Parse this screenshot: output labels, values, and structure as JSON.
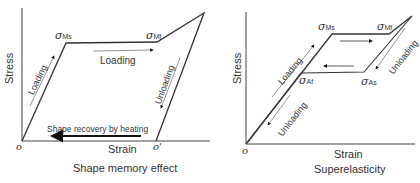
{
  "diagrams": [
    {
      "id": "shape-memory",
      "caption": "Shape memory effect",
      "x_axis_label": "Strain",
      "y_axis_label": "Stress",
      "origin_label": "o",
      "residual_origin_label": "o'",
      "points": {
        "sigma_Ms": {
          "symbol": "σ",
          "sub": "Ms"
        },
        "sigma_Mf": {
          "symbol": "σ",
          "sub": "Mf"
        }
      },
      "annotations": {
        "loading_diag": "Loading",
        "loading_plateau": "Loading",
        "unloading": "Unloading",
        "recovery": "Shape recovery by heating"
      }
    },
    {
      "id": "superelasticity",
      "caption": "Superelasticity",
      "x_axis_label": "Strain",
      "y_axis_label": "Stress",
      "origin_label": "o",
      "points": {
        "sigma_Ms": {
          "symbol": "σ",
          "sub": "Ms"
        },
        "sigma_Mf": {
          "symbol": "σ",
          "sub": "Mf"
        },
        "sigma_As": {
          "symbol": "σ",
          "sub": "As"
        },
        "sigma_Af": {
          "symbol": "σ",
          "sub": "Af"
        }
      },
      "annotations": {
        "loading": "Loading",
        "unloading_upper": "Unloading",
        "unloading_lower": "Unloading"
      }
    }
  ],
  "colors": {
    "line": "#333333",
    "arrow": "#111111",
    "text": "#333333"
  }
}
